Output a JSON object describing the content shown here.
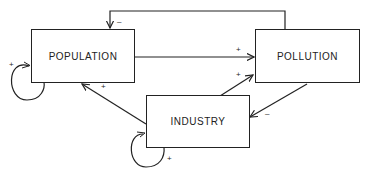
{
  "nodes": {
    "population": "POPULATION",
    "pollution": "POLLUTION",
    "industry": "INDUSTRY"
  },
  "edges": [
    {
      "from": "POLLUTION",
      "to": "POPULATION",
      "sign": "–"
    },
    {
      "from": "POPULATION",
      "to": "POLLUTION",
      "sign": "+"
    },
    {
      "from": "INDUSTRY",
      "to": "POLLUTION",
      "sign": "+"
    },
    {
      "from": "POLLUTION",
      "to": "INDUSTRY",
      "sign": "–"
    },
    {
      "from": "INDUSTRY",
      "to": "POPULATION",
      "sign": "+"
    },
    {
      "from": "POPULATION",
      "to": "POPULATION",
      "sign": "+"
    },
    {
      "from": "INDUSTRY",
      "to": "INDUSTRY",
      "sign": "+"
    }
  ],
  "signs": {
    "pollution_to_population": "–",
    "population_to_pollution": "+",
    "industry_to_pollution": "+",
    "pollution_to_industry": "–",
    "industry_to_population": "+",
    "population_self": "+",
    "industry_self": "+"
  }
}
